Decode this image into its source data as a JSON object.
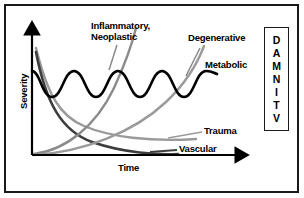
{
  "figure": {
    "axes": {
      "x_label": "Time",
      "y_label": "Severity"
    },
    "curve_labels": {
      "inflammatory_line1": "Inflammatory,",
      "inflammatory_line2": "Neoplastic",
      "degenerative": "Degenerative",
      "metabolic": "Metabolic",
      "trauma": "Trauma",
      "vascular": "Vascular"
    },
    "mnemonic": {
      "letters": [
        "D",
        "A",
        "M",
        "N",
        "I",
        "T",
        "V"
      ]
    },
    "colors": {
      "frame": "#1a1a1a",
      "background": "#ffffff",
      "metabolic": "#000000",
      "vascular": "#3d3d3d",
      "trauma": "#9a9a9a",
      "inflammatory": "#8a8a8a",
      "degenerative": "#9a9a9a",
      "axis": "#000000",
      "leader": "#8a8a8a"
    }
  },
  "chart_data": {
    "type": "line",
    "title": "",
    "xlabel": "Time",
    "ylabel": "Severity",
    "xlim": [
      0,
      1
    ],
    "ylim": [
      0,
      1
    ],
    "grid": false,
    "legend": "inline-labels",
    "annotations": [
      "D",
      "A",
      "M",
      "N",
      "I",
      "T",
      "V"
    ],
    "series": [
      {
        "name": "Vascular",
        "shape": "exponential-decay",
        "description": "Starts at maximum severity, decays rapidly toward zero",
        "x": [
          0.0,
          0.1,
          0.2,
          0.3,
          0.4,
          0.5,
          0.6,
          0.7,
          0.8,
          0.9,
          1.0
        ],
        "values": [
          0.96,
          0.7,
          0.5,
          0.36,
          0.26,
          0.19,
          0.14,
          0.1,
          0.07,
          0.05,
          0.04
        ]
      },
      {
        "name": "Trauma",
        "shape": "exponential-decay",
        "description": "Starts at maximum severity, decays slowly with a long tail",
        "x": [
          0.0,
          0.1,
          0.2,
          0.3,
          0.4,
          0.5,
          0.6,
          0.7,
          0.8,
          0.9,
          1.0
        ],
        "values": [
          0.99,
          0.82,
          0.68,
          0.57,
          0.48,
          0.4,
          0.34,
          0.29,
          0.25,
          0.22,
          0.19
        ]
      },
      {
        "name": "Inflammatory, Neoplastic",
        "shape": "exponential-rise",
        "description": "Starts near zero and rises steeply off the top of the plot",
        "x": [
          0.0,
          0.1,
          0.2,
          0.3,
          0.4,
          0.5,
          0.6
        ],
        "values": [
          0.02,
          0.08,
          0.18,
          0.34,
          0.56,
          0.82,
          1.05
        ]
      },
      {
        "name": "Degenerative",
        "shape": "exponential-rise",
        "description": "Starts near zero and rises gradually then steeply to the top right",
        "x": [
          0.0,
          0.2,
          0.4,
          0.6,
          0.8,
          1.0
        ],
        "values": [
          0.02,
          0.1,
          0.24,
          0.45,
          0.74,
          1.02
        ]
      },
      {
        "name": "Metabolic",
        "shape": "sinusoidal",
        "description": "Oscillates at roughly constant mid severity, three waves",
        "x": [
          0.0,
          0.1,
          0.2,
          0.3,
          0.4,
          0.5,
          0.6,
          0.7,
          0.8,
          0.9,
          1.0
        ],
        "values": [
          0.72,
          0.52,
          0.55,
          0.74,
          0.53,
          0.54,
          0.74,
          0.52,
          0.55,
          0.74,
          0.68
        ]
      }
    ]
  }
}
